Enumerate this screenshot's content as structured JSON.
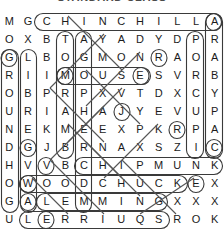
{
  "title": "STANDARD CLASS",
  "puzzle": {
    "kind": "word-search",
    "rows": 12,
    "cols": 12,
    "grid": [
      [
        "M",
        "G",
        "C",
        "H",
        "I",
        "N",
        "C",
        "H",
        "I",
        "L",
        "L",
        "A"
      ],
      [
        "O",
        "X",
        "B",
        "T",
        "A",
        "Y",
        "A",
        "D",
        "Y",
        "D",
        "P",
        "R"
      ],
      [
        "G",
        "L",
        "B",
        "O",
        "G",
        "M",
        "O",
        "N",
        "R",
        "A",
        "O",
        "A"
      ],
      [
        "R",
        "I",
        "I",
        "M",
        "O",
        "U",
        "S",
        "E",
        "S",
        "V",
        "R",
        "B"
      ],
      [
        "O",
        "B",
        "P",
        "R",
        "P",
        "X",
        "V",
        "T",
        "D",
        "X",
        "C",
        "Y"
      ],
      [
        "U",
        "R",
        "I",
        "A",
        "H",
        "A",
        "J",
        "Y",
        "E",
        "V",
        "U",
        "P"
      ],
      [
        "N",
        "E",
        "K",
        "M",
        "E",
        "E",
        "X",
        "P",
        "K",
        "R",
        "P",
        "A"
      ],
      [
        "D",
        "G",
        "J",
        "B",
        "R",
        "N",
        "A",
        "X",
        "S",
        "Z",
        "I",
        "C"
      ],
      [
        "H",
        "V",
        "V",
        "B",
        "C",
        "H",
        "I",
        "P",
        "M",
        "U",
        "N",
        "K"
      ],
      [
        "O",
        "W",
        "O",
        "O",
        "D",
        "C",
        "H",
        "U",
        "C",
        "K",
        "E",
        "X"
      ],
      [
        "G",
        "A",
        "L",
        "E",
        "M",
        "M",
        "I",
        "N",
        "G",
        "X",
        "X",
        "X"
      ],
      [
        "U",
        "L",
        "E",
        "R",
        "R",
        "I",
        "U",
        "Q",
        "S",
        "R",
        "O",
        "K"
      ]
    ],
    "found_words": [
      "CHINCHILLA",
      "MOUSE",
      "CHIPMUNK",
      "WOODCHUCK",
      "LEMMING",
      "SQUIRREL",
      "GROUNDHOG",
      "BEAVER",
      "GOPHER",
      "PORCUPINE",
      "CAPYBARA",
      "MARMOT",
      "RAT"
    ],
    "colors": {
      "letter": "#1b1b1b",
      "circle": "#3a3a3a",
      "strike": "#555555"
    }
  }
}
